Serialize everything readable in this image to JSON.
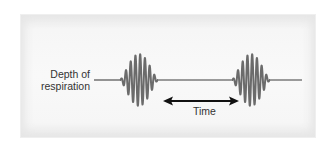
{
  "diagram": {
    "title": "",
    "labels": {
      "y_axis": "Depth of respiration",
      "y_axis_line1": "Depth of",
      "y_axis_line2": "respiration",
      "interval": "Time"
    },
    "colors": {
      "panel_background": "#f6f6f6",
      "waveform": "#6b6b6b",
      "baseline": "#7a7a7a",
      "arrow": "#111111",
      "text": "#333333"
    },
    "waveform": {
      "pattern": "Cheyne-Stokes (crescendo-decrescendo bursts separated by apnea)",
      "baseline_y": 80,
      "baseline_start_x": 94,
      "baseline_end_x": 302,
      "bursts": [
        {
          "start_x": 120,
          "end_x": 158,
          "peak_amplitude": 26,
          "cycles": 8
        },
        {
          "start_x": 232,
          "end_x": 270,
          "peak_amplitude": 26,
          "cycles": 8
        }
      ]
    },
    "interval_arrow": {
      "start_x": 164,
      "end_x": 238,
      "y": 101,
      "double_headed": true
    }
  }
}
